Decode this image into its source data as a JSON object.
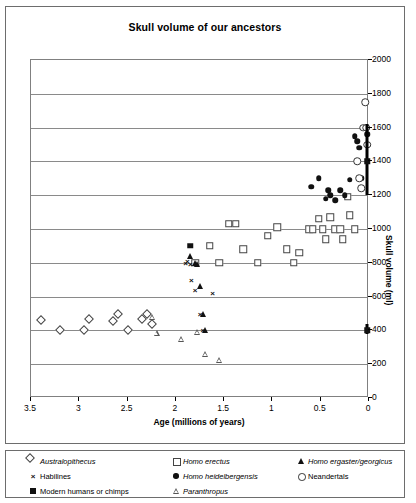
{
  "chart_data": {
    "type": "scatter",
    "title": "Skull volume of our ancestors",
    "xlabel": "Age (millions of years)",
    "ylabel": "Skull volume (ml)",
    "xlim": [
      3.5,
      0
    ],
    "ylim": [
      0,
      2000
    ],
    "x_reversed": true,
    "xticks": [
      "3.5",
      "3",
      "2.5",
      "2",
      "1.5",
      "1",
      "0.5",
      "0"
    ],
    "xtick_values": [
      3.5,
      3,
      2.5,
      2,
      1.5,
      1,
      0.5,
      0
    ],
    "yticks": [
      "0",
      "200",
      "400",
      "600",
      "800",
      "1000",
      "1200",
      "1400",
      "1600",
      "1800",
      "2000"
    ],
    "ytick_values": [
      0,
      200,
      400,
      600,
      800,
      1000,
      1200,
      1400,
      1600,
      1800,
      2000
    ],
    "grid": "horizontal",
    "legend_position": "bottom",
    "series": [
      {
        "name": "Australopithecus",
        "marker": "open-diamond",
        "italic": true,
        "points": [
          [
            3.4,
            460
          ],
          [
            3.2,
            400
          ],
          [
            2.95,
            400
          ],
          [
            2.9,
            470
          ],
          [
            2.65,
            455
          ],
          [
            2.6,
            500
          ],
          [
            2.5,
            400
          ],
          [
            2.35,
            470
          ],
          [
            2.3,
            500
          ],
          [
            2.25,
            440
          ]
        ]
      },
      {
        "name": "Homo erectus",
        "marker": "open-square",
        "italic": true,
        "points": [
          [
            1.8,
            800
          ],
          [
            1.65,
            900
          ],
          [
            1.55,
            800
          ],
          [
            1.45,
            1030
          ],
          [
            1.38,
            1030
          ],
          [
            1.3,
            880
          ],
          [
            1.15,
            800
          ],
          [
            1.05,
            960
          ],
          [
            0.95,
            1010
          ],
          [
            0.85,
            880
          ],
          [
            0.78,
            800
          ],
          [
            0.72,
            860
          ],
          [
            0.62,
            1000
          ],
          [
            0.58,
            1000
          ],
          [
            0.52,
            1060
          ],
          [
            0.48,
            1000
          ],
          [
            0.45,
            940
          ],
          [
            0.4,
            1070
          ],
          [
            0.35,
            1000
          ],
          [
            0.3,
            1000
          ],
          [
            0.27,
            940
          ],
          [
            0.22,
            1190
          ],
          [
            0.2,
            1080
          ],
          [
            0.15,
            1000
          ]
        ]
      },
      {
        "name": "Homo ergaster/georgicus",
        "marker": "filled-triangle",
        "italic": true,
        "points": [
          [
            1.85,
            840
          ],
          [
            1.8,
            800
          ],
          [
            1.78,
            790
          ],
          [
            1.75,
            660
          ],
          [
            1.72,
            500
          ],
          [
            1.7,
            400
          ]
        ]
      },
      {
        "name": "Habilines",
        "marker": "cross",
        "italic": false,
        "points": [
          [
            1.88,
            810
          ],
          [
            1.85,
            790
          ],
          [
            1.84,
            700
          ],
          [
            1.8,
            640
          ],
          [
            1.75,
            500
          ],
          [
            1.72,
            400
          ],
          [
            1.62,
            620
          ],
          [
            1.9,
            800
          ]
        ]
      },
      {
        "name": "Homo heidelbergensis",
        "marker": "filled-circle",
        "italic": true,
        "points": [
          [
            0.6,
            1250
          ],
          [
            0.52,
            1300
          ],
          [
            0.45,
            1180
          ],
          [
            0.42,
            1230
          ],
          [
            0.4,
            1200
          ],
          [
            0.35,
            1170
          ],
          [
            0.3,
            1230
          ],
          [
            0.25,
            1200
          ],
          [
            0.2,
            1290
          ],
          [
            0.15,
            1550
          ],
          [
            0.12,
            1520
          ],
          [
            0.1,
            1480
          ],
          [
            0.08,
            1300
          ],
          [
            0.05,
            1600
          ],
          [
            0.02,
            1560
          ]
        ]
      },
      {
        "name": "Neandertals",
        "marker": "open-circle",
        "italic": false,
        "points": [
          [
            0.12,
            1400
          ],
          [
            0.1,
            1300
          ],
          [
            0.08,
            1240
          ],
          [
            0.06,
            1600
          ],
          [
            0.04,
            1750
          ],
          [
            0.03,
            1600
          ],
          [
            0.02,
            1500
          ]
        ]
      },
      {
        "name": "Modern humans or chimps",
        "marker": "filled-square",
        "italic": false,
        "points": [
          [
            1.85,
            900
          ],
          [
            0.02,
            1400
          ],
          [
            0.02,
            400
          ]
        ],
        "range_bars": [
          {
            "x": 0.02,
            "low": 1200,
            "high": 1620
          },
          {
            "x": 0.02,
            "low": 380,
            "high": 440
          }
        ]
      },
      {
        "name": "Paranthropus",
        "marker": "open-triangle",
        "italic": true,
        "points": [
          [
            2.25,
            480
          ],
          [
            2.2,
            420
          ],
          [
            1.95,
            420
          ],
          [
            1.78,
            500
          ],
          [
            1.7,
            400
          ],
          [
            1.55,
            400
          ]
        ]
      }
    ],
    "legend": [
      {
        "label": "Australopithecus",
        "marker": "open-diamond",
        "italic": true
      },
      {
        "label": "Homo erectus",
        "marker": "open-square",
        "italic": true
      },
      {
        "label": "Homo ergaster/georgicus",
        "marker": "filled-triangle",
        "italic": true
      },
      {
        "label": "Habilines",
        "marker": "cross",
        "italic": false
      },
      {
        "label": "Homo heidelbergensis",
        "marker": "filled-circle",
        "italic": true
      },
      {
        "label": "Neandertals",
        "marker": "open-circle",
        "italic": false
      },
      {
        "label": "Modern humans or chimps",
        "marker": "filled-square",
        "italic": false
      },
      {
        "label": "Paranthropus",
        "marker": "open-triangle",
        "italic": true
      }
    ]
  }
}
